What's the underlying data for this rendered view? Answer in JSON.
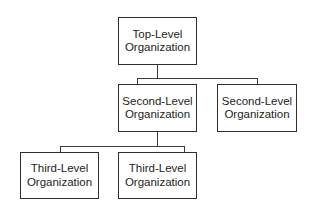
{
  "diagram": {
    "type": "org-chart",
    "nodes": [
      {
        "id": "top",
        "level": 1,
        "line1": "Top-Level",
        "line2": "Organization"
      },
      {
        "id": "second-a",
        "level": 2,
        "parent": "top",
        "line1": "Second-Level",
        "line2": "Organization"
      },
      {
        "id": "second-b",
        "level": 2,
        "parent": "top",
        "line1": "Second-Level",
        "line2": "Organization"
      },
      {
        "id": "third-a",
        "level": 3,
        "parent": "second-a",
        "line1": "Third-Level",
        "line2": "Organization"
      },
      {
        "id": "third-b",
        "level": 3,
        "parent": "second-a",
        "line1": "Third-Level",
        "line2": "Organization"
      }
    ],
    "colors": {
      "line": "#3a3a3a",
      "text": "#1e1e1e",
      "background": "#ffffff"
    }
  }
}
